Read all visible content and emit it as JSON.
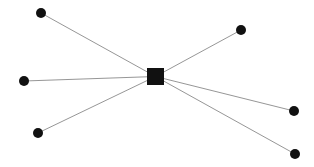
{
  "diagram": {
    "type": "star-graph",
    "width": 314,
    "height": 167,
    "background": "#ffffff",
    "edge_color": "#8a8a8a",
    "node_color": "#111111",
    "hub": {
      "id": "hub",
      "shape": "square",
      "x": 155.5,
      "y": 76.5,
      "size": 17,
      "color": "#111111"
    },
    "leaves": [
      {
        "id": "leaf-top-left",
        "shape": "circle",
        "x": 41,
        "y": 13,
        "r": 5
      },
      {
        "id": "leaf-top-right",
        "shape": "circle",
        "x": 241,
        "y": 30,
        "r": 5
      },
      {
        "id": "leaf-left",
        "shape": "circle",
        "x": 24,
        "y": 81,
        "r": 5
      },
      {
        "id": "leaf-bottom-left",
        "shape": "circle",
        "x": 38,
        "y": 133,
        "r": 5
      },
      {
        "id": "leaf-right",
        "shape": "circle",
        "x": 294,
        "y": 111,
        "r": 5
      },
      {
        "id": "leaf-bottom-right",
        "shape": "circle",
        "x": 295,
        "y": 154,
        "r": 5
      }
    ]
  }
}
